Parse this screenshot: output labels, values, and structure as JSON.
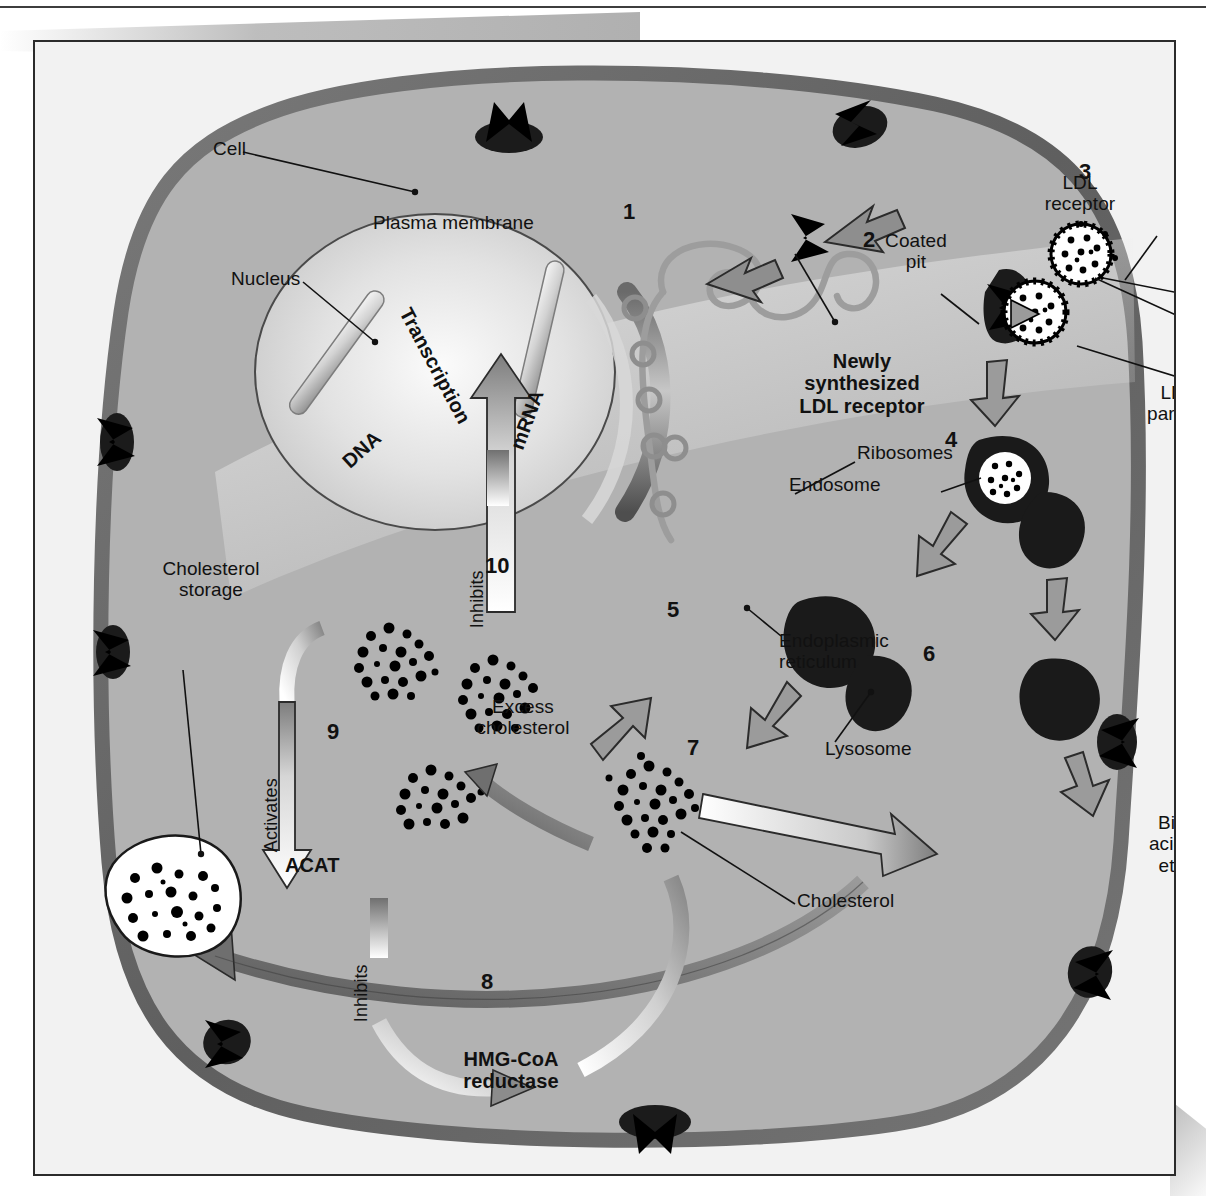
{
  "figure": {
    "type": "biology-diagram",
    "palette": {
      "page_background": "#ffffff",
      "frame_background": "#f2f2f2",
      "cytoplasm": "#b2b2b2",
      "plasma_membrane": "#6e6e6e",
      "nucleus_fill": "#d9d9d9",
      "organelle_dark": "#1a1a1a",
      "arrow_gray": "#8e8e8e",
      "arrow_outline": "#2b2b2b",
      "text": "#111111"
    }
  },
  "labels": {
    "cell": "Cell",
    "plasma_membrane": "Plasma membrane",
    "nucleus": "Nucleus",
    "dna": "DNA",
    "transcription": "Transcription",
    "mrna": "mRNA",
    "ribosomes": "Ribosomes",
    "endoplasmic_reticulum": "Endoplasmic\nreticulum",
    "newly_synthesized_ldl_receptor": "Newly\nsynthesized\nLDL receptor",
    "coated_pit": "Coated\npit",
    "ldl_receptor": "LDL\nreceptor",
    "ldl_particle": "LDL\nparticle",
    "endosome": "Endosome",
    "lysosome": "Lysosome",
    "cholesterol": "Cholesterol",
    "excess_cholesterol": "Excess\ncholesterol",
    "cholesterol_storage": "Cholesterol\nstorage",
    "bile_acids": "Bile\nacids,\netc.",
    "acat": "ACAT",
    "hmg_coa_reductase": "HMG-CoA\nreductase",
    "activates": "Activates",
    "inhibits_8": "Inhibits",
    "inhibits_10": "Inhibits"
  },
  "steps": {
    "s1": "1",
    "s2": "2",
    "s3": "3",
    "s4": "4",
    "s5": "5",
    "s6": "6",
    "s7": "7",
    "s8": "8",
    "s9": "9",
    "s10": "10"
  }
}
